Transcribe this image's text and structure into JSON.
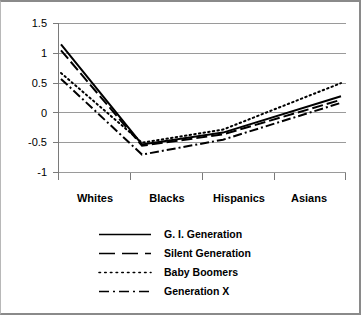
{
  "chart_data": {
    "type": "line",
    "title": "",
    "xlabel": "",
    "ylabel": "",
    "categories": [
      "Whites",
      "Blacks",
      "Hispanics",
      "Asians"
    ],
    "ylim": [
      -1,
      1.5
    ],
    "yticks": [
      "1.5",
      "1",
      "0.5",
      "0",
      "-0.5",
      "-1"
    ],
    "ytick_values": [
      1.5,
      1,
      0.5,
      0,
      -0.5,
      -1
    ],
    "grid": true,
    "legend_position": "bottom",
    "series": [
      {
        "name": "G. I. Generation",
        "style": "solid",
        "values": [
          1.15,
          -0.53,
          -0.33,
          0.28
        ]
      },
      {
        "name": "Silent Generation",
        "style": "dashed",
        "values": [
          1.05,
          -0.55,
          -0.36,
          0.22
        ]
      },
      {
        "name": "Baby Boomers",
        "style": "dotted",
        "values": [
          0.67,
          -0.5,
          -0.28,
          0.5
        ]
      },
      {
        "name": "Generation X",
        "style": "dash-dot",
        "values": [
          0.57,
          -0.7,
          -0.45,
          0.17
        ]
      }
    ]
  },
  "axis": {
    "y_labels": [
      "1.5",
      "1",
      "0.5",
      "0",
      "-0.5",
      "-1"
    ],
    "x_labels": [
      "Whites",
      "Blacks",
      "Hispanics",
      "Asians"
    ]
  },
  "legend": {
    "entries": [
      {
        "label": "G. I. Generation",
        "style": "solid"
      },
      {
        "label": "Silent Generation",
        "style": "dashed"
      },
      {
        "label": "Baby Boomers",
        "style": "dotted"
      },
      {
        "label": "Generation X",
        "style": "dash-dot"
      }
    ]
  },
  "colors": {
    "line": "#000000",
    "grid": "#9a9a9a",
    "axis": "#7a7a7a",
    "background": "#ffffff"
  }
}
